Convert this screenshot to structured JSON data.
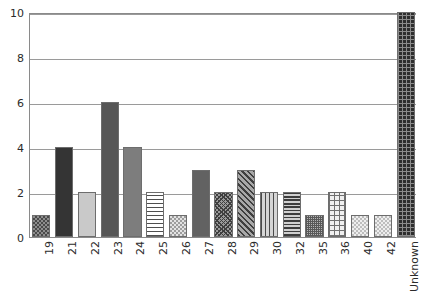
{
  "chart_data": {
    "type": "bar",
    "title": "",
    "subtitle": "",
    "xlabel": "",
    "ylabel": "",
    "categories": [
      "19",
      "21",
      "22",
      "23",
      "24",
      "25",
      "26",
      "27",
      "28",
      "29",
      "30",
      "32",
      "35",
      "36",
      "40",
      "42",
      "Unknown"
    ],
    "values": [
      1,
      4,
      2,
      6,
      4,
      2,
      1,
      3,
      2,
      3,
      2,
      2,
      1,
      2,
      1,
      1,
      10
    ],
    "ylim": [
      0,
      10
    ],
    "yticks": [
      0,
      2,
      4,
      6,
      8,
      10
    ],
    "ytick_labels": [
      "0",
      "2",
      "4",
      "6",
      "8",
      "10"
    ],
    "grid": true,
    "grid_axis": "y",
    "legend": false,
    "legend_position": "none",
    "bar_fill_patterns": [
      "checker-dark",
      "solid-very-dark",
      "solid-light-gray",
      "solid-dark-gray",
      "solid-mid-gray",
      "horizontal-lines",
      "checker-light",
      "solid-mid-dark-gray",
      "diagonal-crosshatch",
      "diagonal-hatch",
      "vertical-lines",
      "horizontal-lines-dense",
      "fine-stipple",
      "grid-crosshatch",
      "checker-very-light",
      "checker-very-light",
      "dark-grid"
    ],
    "bar_edge_color": "#6d6d6d",
    "axis_color": "#8a8a8a",
    "grid_color": "#9a9a9a",
    "background_color": "#ffffff",
    "tick_label_color": "#2b2b2b",
    "xtick_rotation_degrees": 90
  }
}
